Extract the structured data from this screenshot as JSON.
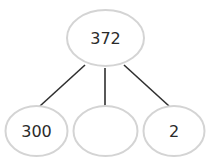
{
  "diagram": {
    "type": "number-bond-tree",
    "colors": {
      "node_stroke": "#d4d4d4",
      "edge": "#2f2f2f",
      "text": "#2a2a2a",
      "background": "#ffffff"
    },
    "root": {
      "label": "372"
    },
    "children": [
      {
        "label": "300"
      },
      {
        "label": ""
      },
      {
        "label": "2"
      }
    ]
  }
}
